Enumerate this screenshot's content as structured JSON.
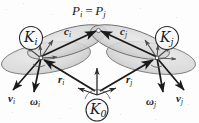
{
  "figure": {
    "caption_top": "P",
    "title_equation": "P_i = P_j",
    "background_color": "#fdfdfd",
    "ink_color": "#1a1a1a",
    "body_fill_color": "#d8d8d8",
    "body_stroke_color": "#707070"
  },
  "labels": {
    "contact_point": {
      "base": "P",
      "sub1": "i",
      "eq": "=",
      "base2": "P",
      "sub2": "j"
    },
    "frame_i": {
      "base": "K",
      "sub": "i"
    },
    "frame_j": {
      "base": "K",
      "sub": "j"
    },
    "frame_0": {
      "base": "K",
      "sub": "0"
    },
    "vector_c_i": {
      "base": "c",
      "sub": "i"
    },
    "vector_c_j": {
      "base": "c",
      "sub": "j"
    },
    "vector_r_i": {
      "base": "r",
      "sub": "i"
    },
    "vector_r_j": {
      "base": "r",
      "sub": "j"
    },
    "vector_v_i": {
      "base": "v",
      "sub": "i"
    },
    "vector_v_j": {
      "base": "v",
      "sub": "j"
    },
    "vector_omega_i": {
      "base": "ω",
      "sub": "i"
    },
    "vector_omega_j": {
      "base": "ω",
      "sub": "j"
    }
  },
  "geometry": {
    "contact_point_xy": [
      98,
      30
    ],
    "body_i_center_xy": [
      40,
      58
    ],
    "body_j_center_xy": [
      157,
      58
    ],
    "origin_frame_xy": [
      97,
      95
    ]
  }
}
